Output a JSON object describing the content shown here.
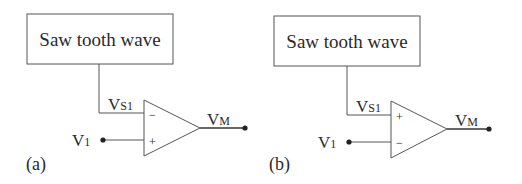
{
  "diagrams": [
    {
      "id": "a",
      "caption": "(a)",
      "source_block": "Saw tooth wave",
      "source_signal": {
        "main": "V",
        "sub": "S1"
      },
      "input": {
        "main": "V",
        "sub": "1"
      },
      "output": {
        "main": "V",
        "sub": "M"
      },
      "top_terminal_sign": "−",
      "bottom_terminal_sign": "+"
    },
    {
      "id": "b",
      "caption": "(b)",
      "source_block": "Saw tooth wave",
      "source_signal": {
        "main": "V",
        "sub": "S1"
      },
      "input": {
        "main": "V",
        "sub": "1"
      },
      "output": {
        "main": "V",
        "sub": "M"
      },
      "top_terminal_sign": "+",
      "bottom_terminal_sign": "−"
    }
  ],
  "colors": {
    "line": "#555555",
    "text": "#2a2a2a",
    "background": "#ffffff"
  }
}
